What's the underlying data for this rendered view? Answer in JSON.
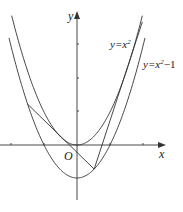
{
  "figure": {
    "type": "coordinate-diagram",
    "axes": {
      "x_label": "x",
      "y_label": "y",
      "origin_label": "O",
      "unit_px": 33,
      "origin_px": [
        77,
        145
      ]
    },
    "curves": [
      {
        "name": "parabola-upper",
        "label": "y=x²",
        "label_base": "y=x",
        "label_sup": "2",
        "label_tail": "",
        "shift": 0
      },
      {
        "name": "parabola-lower",
        "label": "y=x²−1",
        "label_base": "y=x",
        "label_sup": "2",
        "label_tail": "−1",
        "shift": -1
      }
    ],
    "tangent_point_P": {
      "x": 0.52,
      "y": -0.73
    },
    "tangent_touch_x": [
      -0.61,
      1.65
    ],
    "colors": {
      "stroke": "#333333",
      "background": "#ffffff"
    }
  }
}
